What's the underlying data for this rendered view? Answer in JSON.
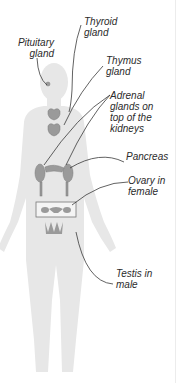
{
  "diagram": {
    "colors": {
      "silhouette": "#e6e6e6",
      "gland": "#9a9a9a",
      "leader_line": "#3a3a3a",
      "text": "#2b2b2b"
    },
    "labels": {
      "pituitary": "Pituitary\ngland",
      "thyroid": "Thyroid\ngland",
      "thymus": "Thymus\ngland",
      "adrenal": "Adrenal\nglands on\ntop of the\nkidneys",
      "pancreas": "Pancreas",
      "ovary": "Ovary in\nfemale",
      "testis": "Testis in\nmale"
    }
  }
}
